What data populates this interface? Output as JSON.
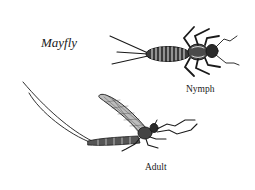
{
  "diagram": {
    "title": "Mayfly",
    "stages": [
      {
        "name": "nymph",
        "label": "Nymph"
      },
      {
        "name": "adult",
        "label": "Adult"
      }
    ],
    "colors": {
      "ink": "#1a1a1a",
      "background": "#ffffff"
    }
  }
}
